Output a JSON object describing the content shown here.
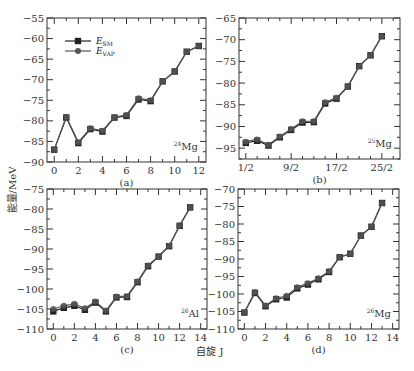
{
  "figure": {
    "ylabel": "能量/MeV",
    "xlabel": "自旋 J"
  },
  "legend": [
    {
      "name": "E_SM",
      "main": "E",
      "sub": "SM",
      "marker": "square",
      "color": "#222222"
    },
    {
      "name": "E_VAP",
      "main": "E",
      "sub": "VAP",
      "marker": "circle",
      "color": "#555555"
    }
  ],
  "chart_data": [
    {
      "type": "line",
      "panel": "(a)",
      "nucleus": {
        "mass": "24",
        "symbol": "Mg"
      },
      "xlim": [
        -0.6,
        12.6
      ],
      "ylim": [
        -90,
        -55
      ],
      "xticks": [
        0,
        2,
        4,
        6,
        8,
        10,
        12
      ],
      "xtick_labels": [
        "0",
        "2",
        "4",
        "6",
        "8",
        "10",
        "12"
      ],
      "yticks": [
        -90,
        -85,
        -80,
        -75,
        -70,
        -65,
        -60,
        -55
      ],
      "ytick_labels": [
        "-90",
        "-85",
        "-80",
        "-75",
        "-70",
        "-65",
        "-60",
        "-55"
      ],
      "x": [
        0,
        1,
        2,
        3,
        4,
        5,
        6,
        7,
        8,
        9,
        10,
        11,
        12
      ],
      "series": [
        {
          "name": "E_SM",
          "values": [
            -87,
            -79.2,
            -85.4,
            -82,
            -82.6,
            -79.2,
            -78.8,
            -74.8,
            -75.2,
            -70.4,
            -68,
            -63.2,
            -61.8
          ]
        },
        {
          "name": "E_VAP",
          "values": [
            -87,
            -79,
            -85.2,
            -81.8,
            -82.4,
            -79.1,
            -78.6,
            -74.5,
            -75,
            -70.4,
            -68,
            -63.2,
            -61.8
          ]
        }
      ],
      "show_legend": true,
      "legend_position": "top-left"
    },
    {
      "type": "line",
      "panel": "(b)",
      "nucleus": {
        "mass": "25",
        "symbol": "Mg"
      },
      "xlim": [
        -0.6,
        13.6
      ],
      "ylim": [
        -97.5,
        -65
      ],
      "xticks": [
        0,
        4,
        8,
        12
      ],
      "xtick_labels": [
        "1/2",
        "9/2",
        "17/2",
        "25/2"
      ],
      "yticks": [
        -95,
        -90,
        -85,
        -80,
        -75,
        -70,
        -65
      ],
      "ytick_labels": [
        "-95",
        "-90",
        "-85",
        "-80",
        "-75",
        "-70",
        "-65"
      ],
      "x": [
        0,
        1,
        2,
        3,
        4,
        5,
        6,
        7,
        8,
        9,
        10,
        11,
        12
      ],
      "x_meaning": "J = (2k+1)/2",
      "series": [
        {
          "name": "E_SM",
          "values": [
            -93.8,
            -93.3,
            -94.4,
            -92.5,
            -90.8,
            -89.1,
            -89,
            -84.7,
            -83.6,
            -80.8,
            -76.1,
            -73.6,
            -69.2
          ]
        },
        {
          "name": "E_VAP",
          "values": [
            -93.5,
            -93,
            -94.2,
            -92.3,
            -90.6,
            -88.8,
            -88.8,
            -84.4,
            -83.4,
            -80.8,
            -76.1,
            -73.6,
            -69.2
          ]
        }
      ],
      "show_legend": false
    },
    {
      "type": "line",
      "panel": "(c)",
      "nucleus": {
        "mass": "26",
        "symbol": "Al"
      },
      "xlim": [
        -0.6,
        14.6
      ],
      "ylim": [
        -110,
        -75
      ],
      "xticks": [
        0,
        2,
        4,
        6,
        8,
        10,
        12,
        14
      ],
      "xtick_labels": [
        "0",
        "2",
        "4",
        "6",
        "8",
        "10",
        "12",
        "14"
      ],
      "yticks": [
        -110,
        -105,
        -100,
        -95,
        -90,
        -85,
        -80,
        -75
      ],
      "ytick_labels": [
        "-110",
        "-105",
        "-100",
        "-95",
        "-90",
        "-85",
        "-80",
        "-75"
      ],
      "x": [
        0,
        1,
        2,
        3,
        4,
        5,
        6,
        7,
        8,
        9,
        10,
        11,
        12,
        13
      ],
      "series": [
        {
          "name": "E_SM",
          "values": [
            -105.6,
            -104.7,
            -104.2,
            -105.2,
            -103.4,
            -105.6,
            -102.1,
            -102,
            -98.3,
            -94.3,
            -91.9,
            -89.3,
            -84.2,
            -79.6
          ]
        },
        {
          "name": "E_VAP",
          "values": [
            -105,
            -104.2,
            -103.7,
            -104.8,
            -103.1,
            -105.4,
            -101.9,
            -101.8,
            -98.1,
            -94.1,
            -91.8,
            -89.2,
            -84.1,
            -79.6
          ]
        }
      ],
      "show_legend": false
    },
    {
      "type": "line",
      "panel": "(d)",
      "nucleus": {
        "mass": "26",
        "symbol": "Mg"
      },
      "xlim": [
        -0.6,
        14.6
      ],
      "ylim": [
        -110,
        -70
      ],
      "xticks": [
        0,
        2,
        4,
        6,
        8,
        10,
        12,
        14
      ],
      "xtick_labels": [
        "0",
        "2",
        "4",
        "6",
        "8",
        "10",
        "12",
        "14"
      ],
      "yticks": [
        -110,
        -105,
        -100,
        -95,
        -90,
        -85,
        -80,
        -75,
        -70
      ],
      "ytick_labels": [
        "-110",
        "-105",
        "-100",
        "-95",
        "-90",
        "-85",
        "-80",
        "-75",
        "-70"
      ],
      "x": [
        0,
        1,
        2,
        3,
        4,
        5,
        6,
        7,
        8,
        9,
        10,
        11,
        12,
        13
      ],
      "series": [
        {
          "name": "E_SM",
          "values": [
            -105.3,
            -99.7,
            -103.5,
            -101.5,
            -101,
            -98.4,
            -97.3,
            -95.8,
            -93.7,
            -89.5,
            -88.5,
            -83.3,
            -80.8,
            -74
          ]
        },
        {
          "name": "E_VAP",
          "values": [
            -105.3,
            -99.4,
            -103.3,
            -101.2,
            -100.5,
            -98.1,
            -96.9,
            -95.5,
            -93.5,
            -89.4,
            -88.5,
            -83.3,
            -80.8,
            -74
          ]
        }
      ],
      "show_legend": false
    }
  ]
}
